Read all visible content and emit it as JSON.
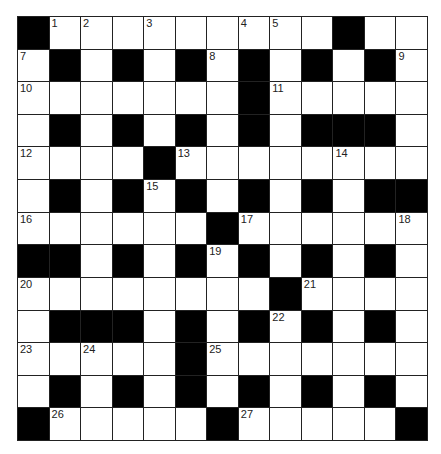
{
  "puzzle": {
    "rows": 13,
    "cols": 13,
    "layout": [
      "#.........#..",
      ".#.#.#.#.#.#.",
      ".......#.....",
      ".#.#.#.#.###.",
      "....#........",
      ".#.#.#.#.#.##",
      "......#......",
      "##.#.#.#.#.#.",
      "........#....",
      ".###.#.#.#.#.",
      ".....#.......",
      ".#.#.#.#.#.#.",
      "#.....#.....#"
    ],
    "numbers": [
      {
        "r": 0,
        "c": 1,
        "n": "1"
      },
      {
        "r": 0,
        "c": 2,
        "n": "2"
      },
      {
        "r": 0,
        "c": 4,
        "n": "3"
      },
      {
        "r": 0,
        "c": 7,
        "n": "4"
      },
      {
        "r": 0,
        "c": 8,
        "n": "5"
      },
      {
        "r": 0,
        "c": 10,
        "n": "6"
      },
      {
        "r": 1,
        "c": 0,
        "n": "7"
      },
      {
        "r": 1,
        "c": 6,
        "n": "8"
      },
      {
        "r": 1,
        "c": 12,
        "n": "9"
      },
      {
        "r": 2,
        "c": 0,
        "n": "10"
      },
      {
        "r": 2,
        "c": 8,
        "n": "11"
      },
      {
        "r": 4,
        "c": 0,
        "n": "12"
      },
      {
        "r": 4,
        "c": 5,
        "n": "13"
      },
      {
        "r": 4,
        "c": 10,
        "n": "14"
      },
      {
        "r": 5,
        "c": 4,
        "n": "15"
      },
      {
        "r": 6,
        "c": 0,
        "n": "16"
      },
      {
        "r": 6,
        "c": 7,
        "n": "17"
      },
      {
        "r": 6,
        "c": 12,
        "n": "18"
      },
      {
        "r": 7,
        "c": 6,
        "n": "19"
      },
      {
        "r": 8,
        "c": 0,
        "n": "20"
      },
      {
        "r": 8,
        "c": 9,
        "n": "21"
      },
      {
        "r": 9,
        "c": 8,
        "n": "22"
      },
      {
        "r": 10,
        "c": 0,
        "n": "23"
      },
      {
        "r": 10,
        "c": 2,
        "n": "24"
      },
      {
        "r": 10,
        "c": 6,
        "n": "25"
      },
      {
        "r": 12,
        "c": 1,
        "n": "26"
      },
      {
        "r": 12,
        "c": 7,
        "n": "27"
      }
    ],
    "colors": {
      "block": "#000000",
      "cell": "#ffffff",
      "line": "#222222"
    }
  }
}
